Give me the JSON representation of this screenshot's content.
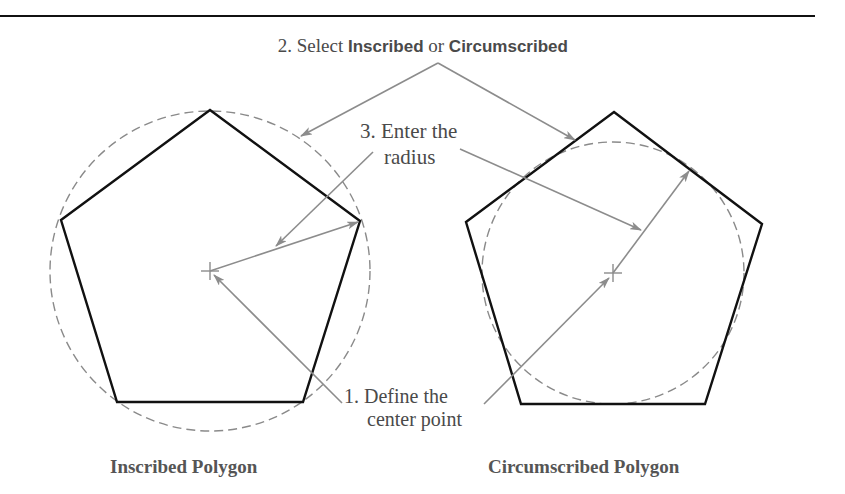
{
  "colors": {
    "polygon_stroke": "#111111",
    "circle_stroke": "#8a8a8a",
    "leader_stroke": "#8c8c8c",
    "label_text": "#4a4a4a",
    "caption_text": "#555555",
    "top_rule": "#111111"
  },
  "callouts": {
    "step1": {
      "line1": "1. Define the",
      "line2": "center point"
    },
    "step2": {
      "prefix": "2. Select ",
      "option1": "Inscribed",
      "joiner": " or ",
      "option2": "Circumscribed"
    },
    "step3": {
      "line1": "3. Enter the",
      "line2": "radius"
    }
  },
  "figures": {
    "inscribed": {
      "caption": "Inscribed Polygon",
      "center": [
        210,
        271
      ],
      "circle_radius": 160,
      "vertices": [
        [
          210,
          110
        ],
        [
          360,
          221
        ],
        [
          303,
          402
        ],
        [
          117,
          402
        ],
        [
          61,
          220
        ]
      ]
    },
    "circumscribed": {
      "caption": "Circumscribed Polygon",
      "center": [
        613,
        273
      ],
      "circle_radius": 131,
      "vertices": [
        [
          614,
          112
        ],
        [
          762,
          224
        ],
        [
          705,
          404
        ],
        [
          521,
          404
        ],
        [
          466,
          222
        ]
      ]
    }
  }
}
